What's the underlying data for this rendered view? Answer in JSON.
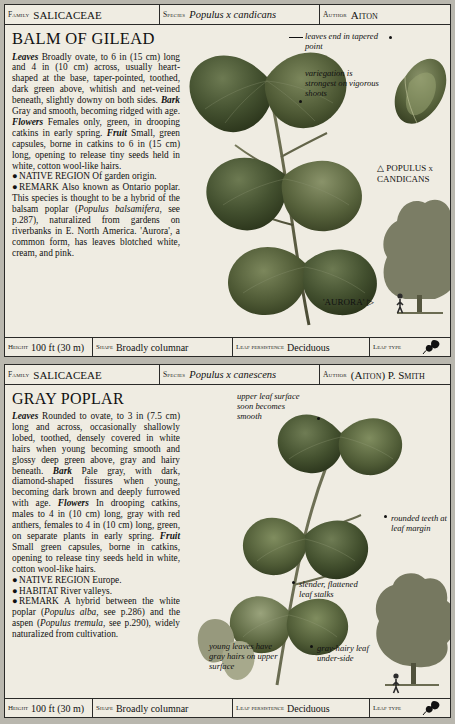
{
  "entries": [
    {
      "header": {
        "family_label": "Family",
        "family": "SALICACEAE",
        "species_label": "Species",
        "species": "Populus x candicans",
        "author_label": "Author",
        "author": "Aiton"
      },
      "title": "BALM OF GILEAD",
      "text_blocks": [
        {
          "runs": [
            {
              "t": "Leaves",
              "style": "bolditalic"
            },
            {
              "t": " Broadly ovate, to 6 in (15 cm) long and 4 in (10 cm) across, usually heart-shaped at the base, taper-pointed, toothed, dark green above, whitish and net-veined beneath, slightly downy on both sides. ",
              "style": "roman"
            },
            {
              "t": "Bark",
              "style": "bolditalic"
            },
            {
              "t": " Gray and smooth, becoming ridged with age. ",
              "style": "roman"
            },
            {
              "t": "Flowers",
              "style": "bolditalic"
            },
            {
              "t": " Females only, green, in drooping catkins in early spring. ",
              "style": "roman"
            },
            {
              "t": "Fruit",
              "style": "bolditalic"
            },
            {
              "t": " Small, green capsules, borne in catkins to 6 in (15 cm) long, opening to release tiny seeds held in white, cotton wool-like hairs.",
              "style": "roman"
            }
          ]
        },
        {
          "bullet": true,
          "runs": [
            {
              "t": "NATIVE REGION",
              "style": "smallcaps"
            },
            {
              "t": " Of garden origin.",
              "style": "roman"
            }
          ]
        },
        {
          "bullet": true,
          "runs": [
            {
              "t": "REMARK",
              "style": "smallcaps"
            },
            {
              "t": " Also known as Ontario poplar. This species is thought to be a hybrid of the balsam poplar (",
              "style": "roman"
            },
            {
              "t": "Populus balsamifera",
              "style": "italic"
            },
            {
              "t": ", see p.287), naturalized from gardens on riverbanks in E. North America. 'Aurora', a common form, has leaves blotched white, cream, and pink.",
              "style": "roman"
            }
          ]
        }
      ],
      "callouts": [
        {
          "text": "leaves end in tapered point",
          "align": "left"
        },
        {
          "text": "variegation is strongest on vigorous shoots",
          "align": "left"
        }
      ],
      "plate_caption": "POPULUS x CANDICANS",
      "specimen_caption": "'AURORA'",
      "footer": {
        "height_label": "Height",
        "height": "100 ft (30 m)",
        "shape_label": "Shape",
        "shape": "Broadly columnar",
        "leaf_persistence_label": "Leaf persistence",
        "leaf_persistence": "Deciduous",
        "leaf_type_label": "Leaf type",
        "leaf_type_icon": "simple-leaf-icon"
      }
    },
    {
      "header": {
        "family_label": "Family",
        "family": "SALICACEAE",
        "species_label": "Species",
        "species": "Populus x canescens",
        "author_label": "Author",
        "author": "(Aiton) P. Smith"
      },
      "title": "GRAY POPLAR",
      "text_blocks": [
        {
          "runs": [
            {
              "t": "Leaves",
              "style": "bolditalic"
            },
            {
              "t": " Rounded to ovate, to 3 in (7.5 cm) long and across, occasionally shallowly lobed, toothed, densely covered in white hairs when young becoming smooth and glossy deep green above, gray and hairy beneath. ",
              "style": "roman"
            },
            {
              "t": "Bark",
              "style": "bolditalic"
            },
            {
              "t": " Pale gray, with dark, diamond-shaped fissures when young, becoming dark brown and deeply furrowed with age. ",
              "style": "roman"
            },
            {
              "t": "Flowers",
              "style": "bolditalic"
            },
            {
              "t": " In drooping catkins, males to 4 in (10 cm) long, gray with red anthers, females to 4 in (10 cm) long, green, on separate plants in early spring. ",
              "style": "roman"
            },
            {
              "t": "Fruit",
              "style": "bolditalic"
            },
            {
              "t": " Small green capsules, borne in catkins, opening to release tiny seeds held in white, cotton wool-like hairs.",
              "style": "roman"
            }
          ]
        },
        {
          "bullet": true,
          "runs": [
            {
              "t": "NATIVE REGION",
              "style": "smallcaps"
            },
            {
              "t": " Europe.",
              "style": "roman"
            }
          ]
        },
        {
          "bullet": true,
          "runs": [
            {
              "t": "HABITAT",
              "style": "smallcaps"
            },
            {
              "t": " River valleys.",
              "style": "roman"
            }
          ]
        },
        {
          "bullet": true,
          "runs": [
            {
              "t": "REMARK",
              "style": "smallcaps"
            },
            {
              "t": " A hybrid between the white poplar (",
              "style": "roman"
            },
            {
              "t": "Populus alba",
              "style": "italic"
            },
            {
              "t": ", see p.286) and the aspen (",
              "style": "roman"
            },
            {
              "t": "Populus tremula",
              "style": "italic"
            },
            {
              "t": ", see p.290), widely naturalized from cultivation.",
              "style": "roman"
            }
          ]
        }
      ],
      "callouts": [
        {
          "text": "upper leaf surface soon becomes smooth",
          "align": "left"
        },
        {
          "text": "rounded teeth at leaf margin",
          "align": "left"
        },
        {
          "text": "slender, flattened leaf stalks",
          "align": "left"
        },
        {
          "text": "young leaves have gray hairs on upper surface",
          "align": "left"
        },
        {
          "text": "gray-hairy leaf under-side",
          "align": "left"
        }
      ],
      "footer": {
        "height_label": "Height",
        "height": "100 ft (30 m)",
        "shape_label": "Shape",
        "shape": "Broadly columnar",
        "leaf_persistence_label": "Leaf persistence",
        "leaf_persistence": "Deciduous",
        "leaf_type_label": "Leaf type",
        "leaf_type_icon": "simple-leaf-icon"
      }
    }
  ]
}
